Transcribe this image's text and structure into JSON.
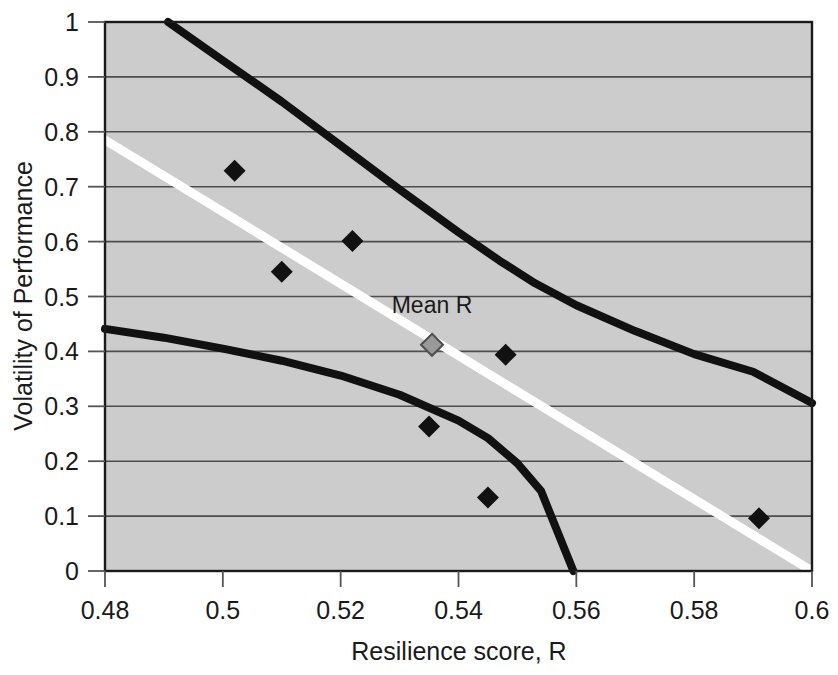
{
  "chart_data": {
    "type": "scatter",
    "title": "",
    "xlabel": "Resilience score, R",
    "ylabel": "Volatility of Performance",
    "xlim": [
      0.48,
      0.6
    ],
    "ylim": [
      0,
      1
    ],
    "xticks": [
      "0.48",
      "0.5",
      "0.52",
      "0.54",
      "0.56",
      "0.58",
      "0.6"
    ],
    "xtick_values": [
      0.48,
      0.5,
      0.52,
      0.54,
      0.56,
      0.58,
      0.6
    ],
    "yticks": [
      "0",
      "0.1",
      "0.2",
      "0.3",
      "0.4",
      "0.5",
      "0.6",
      "0.7",
      "0.8",
      "0.9",
      "1"
    ],
    "ytick_values": [
      0,
      0.1,
      0.2,
      0.3,
      0.4,
      0.5,
      0.6,
      0.7,
      0.8,
      0.9,
      1
    ],
    "grid": "horizontal",
    "legend": "none",
    "plot_background": "#cccccc",
    "series": [
      {
        "name": "Observations",
        "type": "scatter",
        "marker": "diamond",
        "color": "#111111",
        "points": [
          {
            "x": 0.502,
            "y": 0.729
          },
          {
            "x": 0.51,
            "y": 0.545
          },
          {
            "x": 0.522,
            "y": 0.601
          },
          {
            "x": 0.548,
            "y": 0.394
          },
          {
            "x": 0.535,
            "y": 0.263
          },
          {
            "x": 0.545,
            "y": 0.134
          },
          {
            "x": 0.591,
            "y": 0.096
          }
        ]
      },
      {
        "name": "Mean R",
        "type": "scatter",
        "marker": "diamond",
        "color": "#999999",
        "points": [
          {
            "x": 0.5355,
            "y": 0.412
          }
        ]
      },
      {
        "name": "Regression line",
        "type": "line",
        "color": "#ffffff",
        "points": [
          {
            "x": 0.48,
            "y": 0.785
          },
          {
            "x": 0.6,
            "y": 0.0
          }
        ]
      },
      {
        "name": "Upper confidence band",
        "type": "line",
        "color": "#111111",
        "points": [
          {
            "x": 0.4907,
            "y": 1.0
          },
          {
            "x": 0.5,
            "y": 0.93
          },
          {
            "x": 0.51,
            "y": 0.855
          },
          {
            "x": 0.52,
            "y": 0.775
          },
          {
            "x": 0.53,
            "y": 0.695
          },
          {
            "x": 0.54,
            "y": 0.617
          },
          {
            "x": 0.547,
            "y": 0.565
          },
          {
            "x": 0.553,
            "y": 0.524
          },
          {
            "x": 0.56,
            "y": 0.484
          },
          {
            "x": 0.57,
            "y": 0.437
          },
          {
            "x": 0.58,
            "y": 0.395
          },
          {
            "x": 0.59,
            "y": 0.363
          },
          {
            "x": 0.6,
            "y": 0.306
          }
        ]
      },
      {
        "name": "Lower confidence band",
        "type": "line",
        "color": "#111111",
        "points": [
          {
            "x": 0.48,
            "y": 0.441
          },
          {
            "x": 0.49,
            "y": 0.425
          },
          {
            "x": 0.5,
            "y": 0.405
          },
          {
            "x": 0.51,
            "y": 0.383
          },
          {
            "x": 0.52,
            "y": 0.356
          },
          {
            "x": 0.53,
            "y": 0.321
          },
          {
            "x": 0.54,
            "y": 0.274
          },
          {
            "x": 0.545,
            "y": 0.242
          },
          {
            "x": 0.55,
            "y": 0.196
          },
          {
            "x": 0.554,
            "y": 0.146
          },
          {
            "x": 0.5595,
            "y": 0.0
          }
        ]
      }
    ],
    "annotations": [
      {
        "text": "Mean R",
        "x": 0.5355,
        "y": 0.47,
        "name": "mean-r-label"
      }
    ]
  }
}
